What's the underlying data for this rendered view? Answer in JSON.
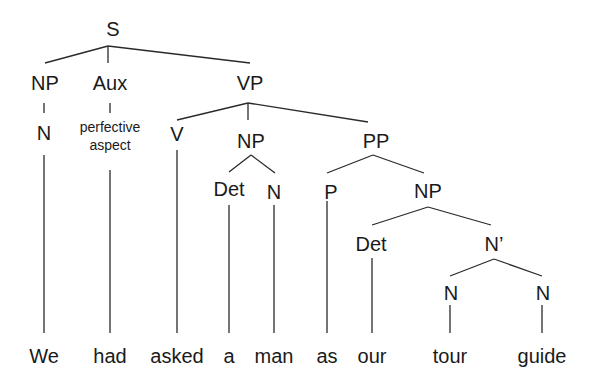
{
  "diagram": {
    "type": "syntax-tree",
    "sentence": "We had asked a man as our tour guide",
    "colors": {
      "line": "#2a2a2a",
      "text": "#1a1a1a",
      "background": "#ffffff"
    },
    "nodes": [
      {
        "id": "S",
        "label": "S",
        "x": 113,
        "y": 36
      },
      {
        "id": "NP1",
        "label": "NP",
        "x": 45,
        "y": 90
      },
      {
        "id": "Aux",
        "label": "Aux",
        "x": 110,
        "y": 90
      },
      {
        "id": "VP",
        "label": "VP",
        "x": 250,
        "y": 90
      },
      {
        "id": "N1",
        "label": "N",
        "x": 44,
        "y": 140
      },
      {
        "id": "Asp1",
        "label": "perfective",
        "x": 110,
        "y": 132,
        "small": true
      },
      {
        "id": "Asp2",
        "label": "aspect",
        "x": 110,
        "y": 150,
        "small": true
      },
      {
        "id": "V",
        "label": "V",
        "x": 177,
        "y": 141
      },
      {
        "id": "NP2",
        "label": "NP",
        "x": 251,
        "y": 148
      },
      {
        "id": "PP",
        "label": "PP",
        "x": 376,
        "y": 148
      },
      {
        "id": "Det1",
        "label": "Det",
        "x": 229,
        "y": 196
      },
      {
        "id": "N2",
        "label": "N",
        "x": 274,
        "y": 199
      },
      {
        "id": "P",
        "label": "P",
        "x": 331,
        "y": 199
      },
      {
        "id": "NP3",
        "label": "NP",
        "x": 428,
        "y": 198
      },
      {
        "id": "Det2",
        "label": "Det",
        "x": 371,
        "y": 251
      },
      {
        "id": "Nbar",
        "label": "N’",
        "x": 494,
        "y": 251
      },
      {
        "id": "N3",
        "label": "N",
        "x": 451,
        "y": 300
      },
      {
        "id": "N4",
        "label": "N",
        "x": 543,
        "y": 300
      }
    ],
    "edges": [
      [
        108,
        46,
        45,
        63
      ],
      [
        108,
        46,
        108,
        63
      ],
      [
        108,
        46,
        250,
        63
      ],
      [
        44,
        103,
        44,
        113
      ],
      [
        110,
        103,
        110,
        113
      ],
      [
        248,
        103,
        177,
        120
      ],
      [
        248,
        103,
        248,
        120
      ],
      [
        248,
        103,
        368,
        122
      ],
      [
        44,
        155,
        44,
        333
      ],
      [
        110,
        170,
        110,
        333
      ],
      [
        177,
        150,
        177,
        333
      ],
      [
        251,
        155,
        229,
        172
      ],
      [
        251,
        155,
        275,
        173
      ],
      [
        229,
        205,
        229,
        333
      ],
      [
        274,
        205,
        274,
        333
      ],
      [
        373,
        155,
        327,
        173
      ],
      [
        373,
        155,
        424,
        173
      ],
      [
        327,
        201,
        327,
        333
      ],
      [
        428,
        207,
        372,
        225
      ],
      [
        428,
        207,
        491,
        225
      ],
      [
        372,
        258,
        372,
        333
      ],
      [
        494,
        259,
        450,
        276
      ],
      [
        494,
        259,
        542,
        276
      ],
      [
        450,
        305,
        450,
        333
      ],
      [
        542,
        305,
        542,
        333
      ]
    ],
    "leaves": [
      {
        "word": "We",
        "x": 44
      },
      {
        "word": "had",
        "x": 110
      },
      {
        "word": "asked",
        "x": 177
      },
      {
        "word": "a",
        "x": 229
      },
      {
        "word": "man",
        "x": 274
      },
      {
        "word": "as",
        "x": 327
      },
      {
        "word": "our",
        "x": 372
      },
      {
        "word": "tour",
        "x": 450
      },
      {
        "word": "guide",
        "x": 542
      }
    ],
    "leaf_y": 363
  }
}
